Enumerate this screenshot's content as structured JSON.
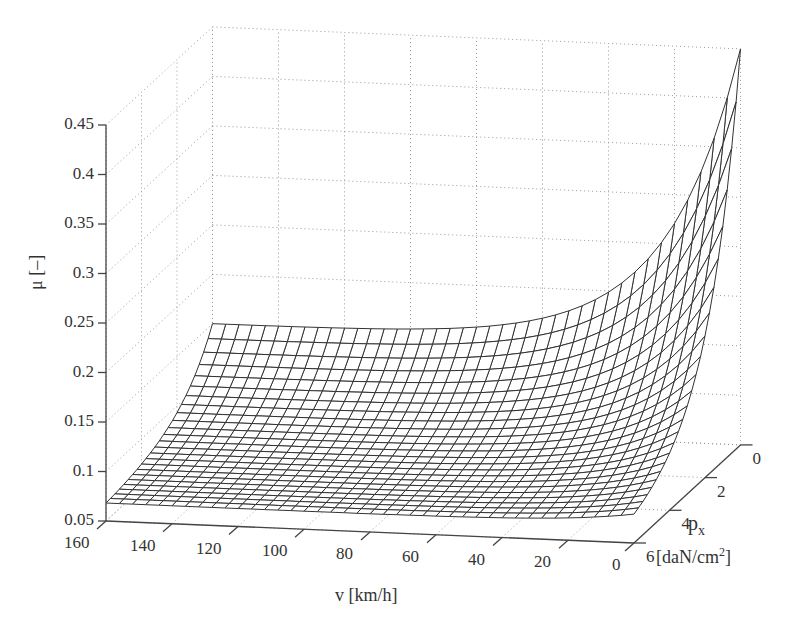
{
  "chart_data": {
    "type": "surface",
    "title": "",
    "xlabel": "v [km/h]",
    "ylabel": "p_x [daN/cm^2]",
    "zlabel": "μ [–]",
    "x_ticks": [
      160,
      140,
      120,
      100,
      80,
      60,
      40,
      20,
      0
    ],
    "y_ticks": [
      0,
      2,
      4,
      6
    ],
    "z_ticks": [
      "0.05",
      "0.1",
      "0.15",
      "0.2",
      "0.25",
      "0.3",
      "0.35",
      "0.4",
      "0.45"
    ],
    "xlim": [
      0,
      160
    ],
    "ylim": [
      0,
      6
    ],
    "zlim": [
      0.05,
      0.45
    ],
    "grid": true,
    "mesh": {
      "nv": 40,
      "npx": 24
    },
    "approx_corner_values": [
      {
        "v": 0,
        "px": 0,
        "mu": 0.45
      },
      {
        "v": 160,
        "px": 0,
        "mu": 0.15
      },
      {
        "v": 80,
        "px": 0,
        "mu": 0.16
      },
      {
        "v": 0,
        "px": 6,
        "mu": 0.08
      },
      {
        "v": 160,
        "px": 6,
        "mu": 0.07
      }
    ]
  },
  "labels": {
    "v_axis": "v [km/h]",
    "px_axis_main": "p",
    "px_axis_sub": "x",
    "px_unit_pre": "[daN/cm",
    "px_unit_sup": "2",
    "px_unit_post": "]",
    "mu_axis": "μ [–]"
  },
  "colors": {
    "mesh": "#333333",
    "axis": "#444444",
    "grid": "#999999",
    "face": "#ffffff"
  }
}
